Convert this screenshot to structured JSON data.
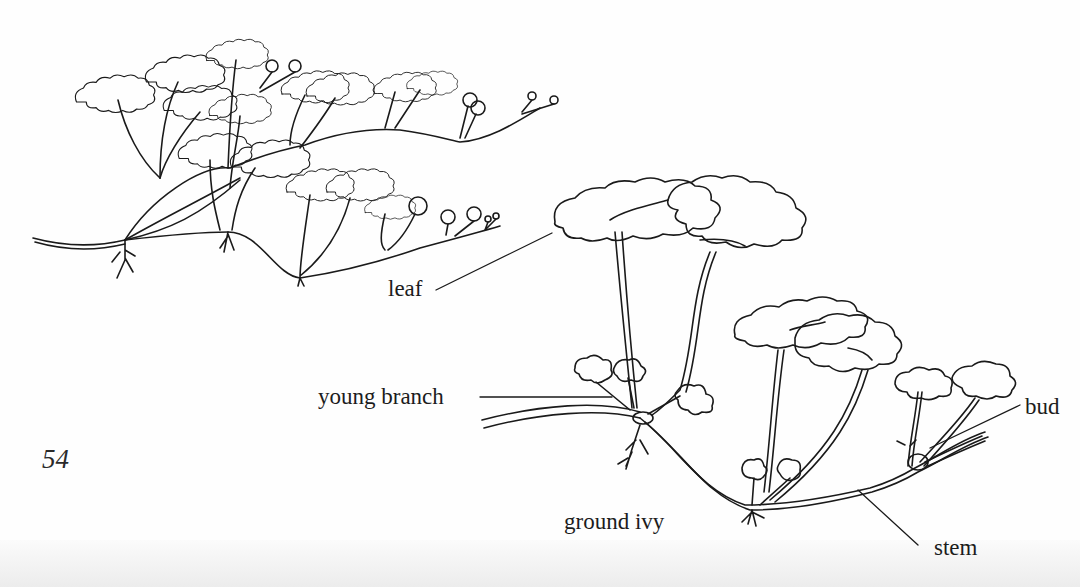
{
  "page": {
    "page_number": "54",
    "figure": {
      "title_label": "ground ivy",
      "labels": [
        {
          "id": "leaf",
          "text": "leaf"
        },
        {
          "id": "young-branch",
          "text": "young branch"
        },
        {
          "id": "bud",
          "text": "bud"
        },
        {
          "id": "stem",
          "text": "stem"
        }
      ]
    },
    "colors": {
      "ink": "#1a1a1a",
      "paper": "#fefefe"
    }
  }
}
